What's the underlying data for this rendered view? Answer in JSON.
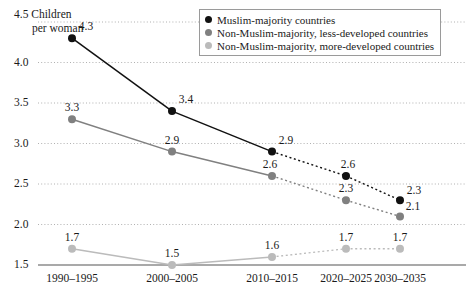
{
  "axis": {
    "y_label_line1": "4.5 Children",
    "y_label_line2": "per woman",
    "y_ticks": [
      "4.0",
      "3.5",
      "3.0",
      "2.5",
      "2.0",
      "1.5"
    ],
    "x_ticks": [
      "1990–1995",
      "2000–2005",
      "2010–2015",
      "2020–2025",
      "2030–2035"
    ]
  },
  "legend": {
    "items": [
      {
        "label": "Muslim-majority countries",
        "color": "#111111"
      },
      {
        "label": "Non-Muslim-majority, less-developed countries",
        "color": "#808080"
      },
      {
        "label": "Non-Muslim-majority, more-developed countries",
        "color": "#bbbbbb"
      }
    ]
  },
  "chart_data": {
    "type": "line",
    "title": "",
    "subtitle": "",
    "xlabel": "",
    "ylabel": "Children per woman",
    "ylim": [
      1.5,
      4.5
    ],
    "ytick_step": 0.5,
    "grid": true,
    "legend_position": "top-right",
    "projection_note": "Values from 2020–2025 onward are projections, drawn with dotted line segments beginning after the 2010–2015 data point.",
    "categories": [
      "1990–1995",
      "2000–2005",
      "2010–2015",
      "2020–2025",
      "2030–2035"
    ],
    "series": [
      {
        "name": "Muslim-majority countries",
        "color": "#111111",
        "values": [
          4.3,
          3.4,
          2.9,
          2.6,
          2.3
        ],
        "labels": [
          "4.3",
          "3.4",
          "2.9",
          "2.6",
          "2.3"
        ],
        "solid_through_index": 2
      },
      {
        "name": "Non-Muslim-majority, less-developed countries",
        "color": "#808080",
        "values": [
          3.3,
          2.9,
          2.6,
          2.3,
          2.1
        ],
        "labels": [
          "3.3",
          "2.9",
          "2.6",
          "2.3",
          "2.1"
        ],
        "solid_through_index": 2
      },
      {
        "name": "Non-Muslim-majority, more-developed countries",
        "color": "#bbbbbb",
        "values": [
          1.7,
          1.5,
          1.6,
          1.7,
          1.7
        ],
        "labels": [
          "1.7",
          "1.5",
          "1.6",
          "1.7",
          "1.7"
        ],
        "solid_through_index": 2
      }
    ]
  }
}
